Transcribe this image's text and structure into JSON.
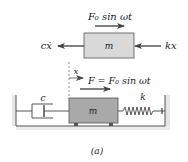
{
  "figure": {
    "caption": "(a)",
    "free_body": {
      "mass_label": "m",
      "applied_force": "F₀ sin ωt",
      "damping_force": "cẋ",
      "spring_force": "kx"
    },
    "system": {
      "mass_label": "m",
      "damper_label": "c",
      "spring_label": "k",
      "displacement_label": "x",
      "applied_force": "F = F₀ sin ωt"
    },
    "colors": {
      "mass_fill": "#d2d2d2",
      "mass_fill_dark": "#a9a9a9",
      "line": "#333333",
      "wall_shade": "#e6e6e6"
    }
  }
}
